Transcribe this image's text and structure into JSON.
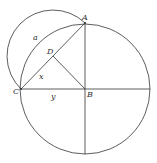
{
  "diagram": {
    "title": "",
    "points": {
      "A": {
        "label": "A",
        "x": 85,
        "y": 23
      },
      "B": {
        "label": "B",
        "x": 85,
        "y": 89
      },
      "C": {
        "label": "C",
        "x": 21,
        "y": 89
      },
      "D": {
        "label": "D",
        "x": 53,
        "y": 56
      }
    },
    "segment_labels": {
      "a": "a",
      "x": "x",
      "y": "y"
    },
    "colors": {
      "stroke": "#333333",
      "background": "#ffffff"
    }
  }
}
